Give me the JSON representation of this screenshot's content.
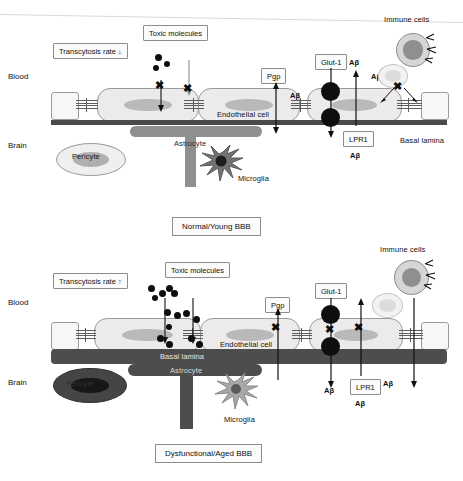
{
  "figure": {
    "title_top": "Normal/Young BBB",
    "title_bottom": "Dysfunctional/Aged BBB"
  },
  "panels": [
    {
      "id": "normal-young-bbb",
      "caption": "Normal/Young BBB",
      "side_labels": {
        "blood": "Blood",
        "brain": "Brain"
      },
      "boxes": {
        "transcytosis": "Transcytosis rate ↓",
        "toxic_molecules": "Toxic molecules",
        "pgp": "Pgp",
        "glut1": "Glut-1",
        "lpr1": "LPR1"
      },
      "cell_labels": {
        "endothelial": "Endothelial cell",
        "pericyte": "Pericyte",
        "astrocyte": "Astrocyte",
        "microglia": "Microglia",
        "basal_lamina": "Basal lamina",
        "immune_cells": "Immune cells"
      },
      "molecule_labels": {
        "abeta_1": "Aβ",
        "abeta_2": "Aβ",
        "abeta_3": "Aβ",
        "abeta_4": "Aβ",
        "abeta_5": "Aβ"
      },
      "state": {
        "transcytosis_direction": "down",
        "toxic_dot_count": 3,
        "blocked_transport_count": 2,
        "basal_lamina_style": "thin-intact",
        "pericyte_state": "healthy",
        "astrocyte_state": "healthy"
      }
    },
    {
      "id": "dysfunctional-aged-bbb",
      "caption": "Dysfunctional/Aged BBB",
      "side_labels": {
        "blood": "Blood",
        "brain": "Brain"
      },
      "boxes": {
        "transcytosis": "Transcytosis rate ↑",
        "toxic_molecules": "Toxic molecules",
        "pgp": "Pgp",
        "glut1": "Glut-1",
        "lpr1": "LPR1"
      },
      "cell_labels": {
        "endothelial": "Endothelial cell",
        "pericyte": "Pericyte",
        "astrocyte": "Astrocyte",
        "microglia": "Microglia",
        "basal_lamina": "Basal lamina",
        "immune_cells": "Immune cells"
      },
      "molecule_labels": {
        "abeta_1": "Aβ",
        "abeta_2": "Aβ",
        "abeta_3": "Aβ",
        "abeta_4": "Aβ"
      },
      "state": {
        "transcytosis_direction": "up",
        "toxic_dot_count": 14,
        "blocked_transport_count": 4,
        "basal_lamina_style": "thickened",
        "pericyte_state": "degenerated",
        "astrocyte_state": "reactive"
      }
    }
  ],
  "colors": {
    "endothelial_fill": "#eceaea",
    "endothelial_nucleus": "#b9b9b9",
    "basal_lamina": "#4a4a4a",
    "astrocyte": "#8f8f8f",
    "astrocyte_reactive": "#4d4d4d",
    "molecule": "#0e0e0e",
    "immune_active": "#d6d6d6",
    "box_border": "#8d8d8d"
  }
}
